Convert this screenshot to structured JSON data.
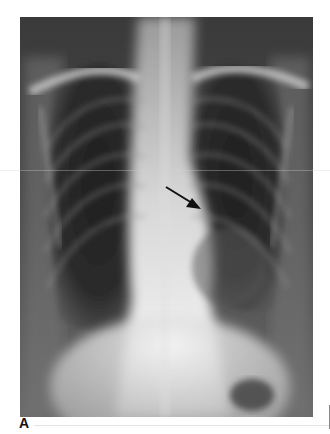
{
  "figure": {
    "panel_label": "A",
    "annotation": {
      "type": "arrow",
      "icon": "arrow-icon",
      "color": "#111111",
      "points_to": "left mediastinal/cardiac border mass"
    }
  },
  "colors": {
    "background": "#ffffff",
    "film_dark": "#2e2e2e",
    "bone_light": "#d8d8d8",
    "mediastinum": "#f2f2f2"
  }
}
